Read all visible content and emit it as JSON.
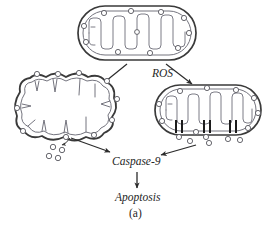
{
  "figure": {
    "panel_label": "(a)",
    "caption_labels": {
      "ros": "ROS",
      "caspase": "Caspase-9",
      "apoptosis": "Apoptosis"
    },
    "colors": {
      "outline": "#3a3a3a",
      "inner_membrane": "#6e6e78",
      "cristae": "#7c7c86",
      "pore": "#1c1c1c",
      "particle_stroke": "#56565e",
      "arrow": "#2b2b2b",
      "background": "#ffffff",
      "text": "#262626"
    },
    "nodes": [
      {
        "id": "healthy-mitochondrion",
        "name": "healthy-mitochondrion",
        "state": "intact",
        "cx": 137,
        "cy": 33,
        "rx": 59,
        "ry": 27,
        "surface_particles": 11,
        "cristae_folds": 8
      },
      {
        "id": "swollen-mitochondrion",
        "name": "swollen-mitochondrion",
        "state": "swollen-ruptured",
        "cx": 66,
        "cy": 108,
        "rx": 55,
        "ry": 35,
        "surface_particles": 10,
        "released_particles": 4,
        "cristae_folds": 8
      },
      {
        "id": "pore-mitochondrion",
        "name": "pore-forming-mitochondrion",
        "state": "pore-formation",
        "cx": 208,
        "cy": 110,
        "rx": 53,
        "ry": 26,
        "surface_particles": 9,
        "pore_groups": 3,
        "bars_per_pore": 2,
        "released_particles": 6,
        "cristae_folds": 8
      }
    ],
    "edges": [
      {
        "id": "edge-top-to-left",
        "name": "arrow-healthy-to-swollen",
        "from": "healthy-mitochondrion",
        "to": "swollen-mitochondrion"
      },
      {
        "id": "edge-top-to-right",
        "name": "arrow-healthy-to-pore",
        "from": "healthy-mitochondrion",
        "to": "pore-mitochondrion"
      },
      {
        "id": "edge-left-to-casp",
        "name": "arrow-swollen-to-caspase",
        "from": "swollen-mitochondrion",
        "to": "caspase-9"
      },
      {
        "id": "edge-right-to-casp",
        "name": "arrow-pore-to-caspase",
        "from": "pore-mitochondrion",
        "to": "caspase-9"
      },
      {
        "id": "edge-casp-to-apop",
        "name": "arrow-caspase-to-apoptosis",
        "from": "caspase-9",
        "to": "apoptosis"
      },
      {
        "id": "edge-release",
        "name": "arrow-cytochrome-release",
        "from": "swollen-mitochondrion",
        "to": "released-particles"
      }
    ]
  }
}
